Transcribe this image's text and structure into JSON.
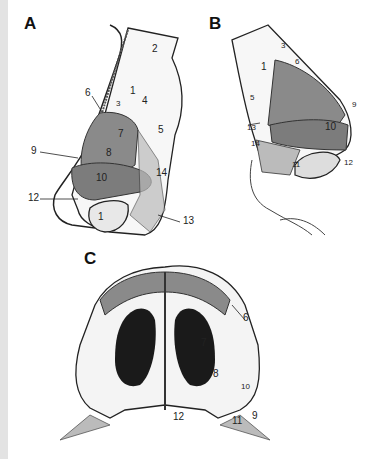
{
  "figure": {
    "panels": [
      {
        "id": "A",
        "letter": "A",
        "view": "lateral",
        "labels": [
          "2",
          "1",
          "6",
          "3",
          "4",
          "5",
          "7",
          "8",
          "9",
          "10",
          "14",
          "12",
          "11",
          "13"
        ]
      },
      {
        "id": "B",
        "letter": "B",
        "view": "lateral (opposite)",
        "labels": [
          "3",
          "1",
          "6",
          "5",
          "9",
          "13",
          "10",
          "14",
          "11",
          "12"
        ]
      },
      {
        "id": "C",
        "letter": "C",
        "view": "basal",
        "labels": [
          "6",
          "7",
          "8",
          "10",
          "12",
          "11",
          "9"
        ]
      }
    ]
  },
  "panelA": {
    "letter": "A",
    "l1": "1",
    "l2": "2",
    "l3": "3",
    "l4": "4",
    "l5": "5",
    "l6": "6",
    "l7": "7",
    "l8": "8",
    "l9": "9",
    "l10": "10",
    "l11": "1",
    "l12": "12",
    "l13": "13",
    "l14": "14"
  },
  "panelB": {
    "letter": "B",
    "l1": "1",
    "l3": "3",
    "l5": "5",
    "l6": "6",
    "l9": "9",
    "l10": "10",
    "l11": "11",
    "l12": "12",
    "l13": "13",
    "l14": "14"
  },
  "panelC": {
    "letter": "C",
    "l6": "6",
    "l7": "7",
    "l8": "8",
    "l9": "9",
    "l10": "10",
    "l11": "11",
    "l12": "12"
  },
  "colors": {
    "background": "#ffffff",
    "left_strip": "#e3e3e3",
    "shaded_cartilage": "#8a8a8a",
    "dark_cavity": "#1a1a1a",
    "outline": "#222222",
    "skin": "#f4f4f4"
  }
}
